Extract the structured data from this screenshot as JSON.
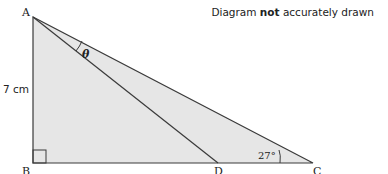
{
  "diagram": {
    "note_prefix": "Diagram ",
    "note_bold": "not",
    "note_suffix": " accurately drawn",
    "vertices": {
      "A": {
        "label": "A",
        "x": 33,
        "y": 17
      },
      "B": {
        "label": "B",
        "x": 33,
        "y": 163
      },
      "C": {
        "label": "C",
        "x": 313,
        "y": 163
      },
      "D": {
        "label": "D",
        "x": 218,
        "y": 163
      }
    },
    "side_label_AB": "7 cm",
    "angle_C": "27°",
    "angle_theta": "θ",
    "right_angle_at": "B",
    "fill_color": "#e6e6e6",
    "stroke_color": "#3a3a3a"
  }
}
